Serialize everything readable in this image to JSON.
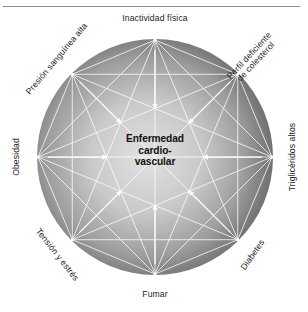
{
  "figure": {
    "title_center": "Enfermedad\ncardio-\nvascular",
    "center_color": "#111111",
    "circle_fill_light": "#d6d6d6",
    "circle_fill_dark": "#555555",
    "line_color": "#ffffff",
    "rule_color": "#8d8d8d"
  },
  "nodes": [
    {
      "id": "inactividad-fisica",
      "label": "Inactividad física",
      "angle_deg": 90,
      "label_rotation": 0
    },
    {
      "id": "perfil-colesterol",
      "label": "Perfil deficiente\nde colesterol",
      "angle_deg": 45,
      "label_rotation": -47
    },
    {
      "id": "trigliceridos-altos",
      "label": "Triglicéridos altos",
      "angle_deg": 0,
      "label_rotation": -90
    },
    {
      "id": "diabetes",
      "label": "Diabetes",
      "angle_deg": -45,
      "label_rotation": -55
    },
    {
      "id": "fumar",
      "label": "Fumar",
      "angle_deg": -90,
      "label_rotation": 0
    },
    {
      "id": "tension-y-estres",
      "label": "Tensión y estrés",
      "angle_deg": -135,
      "label_rotation": 52
    },
    {
      "id": "obesidad",
      "label": "Obesidad",
      "angle_deg": 180,
      "label_rotation": -90
    },
    {
      "id": "presion-sanguinea-alta",
      "label": "Presión sanguínea alta",
      "angle_deg": 135,
      "label_rotation": -50
    }
  ],
  "chart_data": {
    "type": "diagram",
    "subtype": "radial-network",
    "center_node": "Enfermedad cardio-vascular",
    "categories": [
      "Inactividad física",
      "Perfil deficiente de colesterol",
      "Triglicéridos altos",
      "Diabetes",
      "Fumar",
      "Tensión y estrés",
      "Obesidad",
      "Presión sanguínea alta"
    ],
    "edges_description": "Every risk factor is connected to every other risk factor and points with an arrow to the central node.",
    "node_count": 8,
    "arrows_to_center": 8,
    "legend": [],
    "grid": false
  }
}
